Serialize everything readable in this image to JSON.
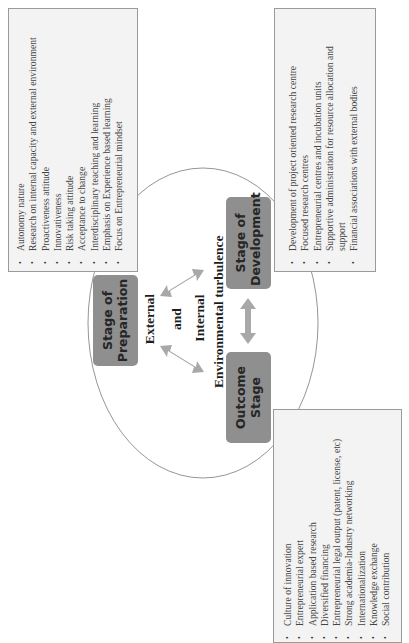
{
  "diagram": {
    "orientation": "rotated -90 degrees (text reads bottom-to-top)",
    "center_text": {
      "line1": "External",
      "line2": "and",
      "line3": "Internal",
      "line4": "Environmental turbulence"
    },
    "stages": [
      {
        "id": "preparation",
        "line1": "Stage of",
        "line2": "Preparation"
      },
      {
        "id": "development",
        "line1": "Stage of",
        "line2": "Development"
      },
      {
        "id": "outcome",
        "line1": "Outcome",
        "line2": "Stage"
      }
    ],
    "preparation_list": {
      "items": [
        "Autonomy nature",
        "Research on internal capacity and external environment",
        "Proactiveness attitude",
        "Innovativeness",
        "Risk taking attitude",
        "Acceptance to change",
        "Interdisciplinary teaching and learning",
        "Emphasis on Experience based learning",
        "Focus on Entrepreneurial mindset"
      ]
    },
    "development_list": {
      "items": [
        "Development of project oriented research centre",
        "Focused research centres",
        "Entrepreneurial centres and incubation units",
        "Supportive administration for resource allocation and",
        "support",
        "Financial associations with external bodies"
      ]
    },
    "outcome_list": {
      "items": [
        "Culture of innovation",
        "Entrepreneurial expert",
        "Application based research",
        "Diversified financing",
        "Entrepreneurial legal output (patent, license, etc)",
        "Strong academia-Industry networking",
        "Internationalization",
        "Knowledge exchange",
        "Social contribution"
      ]
    },
    "colors": {
      "stage_box": "#8f8f8f",
      "list_box_bg": "#f3f3f3",
      "list_box_border": "#9a9a9a",
      "arrow": "#a8a8a8",
      "circle_stroke": "#7a7a7a"
    }
  }
}
